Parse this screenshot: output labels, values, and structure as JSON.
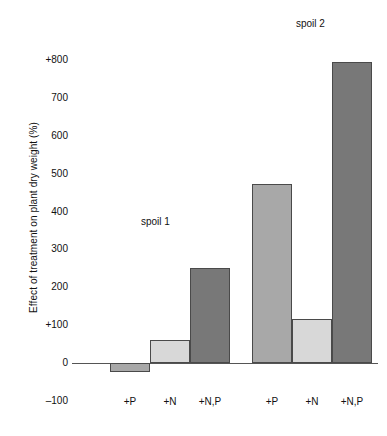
{
  "chart_data": {
    "type": "bar",
    "title": "",
    "xlabel": "",
    "ylabel": "Effect of treatment on plant dry weight (%)",
    "ylim": [
      -100,
      800
    ],
    "yticks": [
      {
        "label": "+800",
        "value": 800
      },
      {
        "label": "700",
        "value": 700
      },
      {
        "label": "600",
        "value": 600
      },
      {
        "label": "500",
        "value": 500
      },
      {
        "label": "400",
        "value": 400
      },
      {
        "label": "300",
        "value": 300
      },
      {
        "label": "200",
        "value": 200
      },
      {
        "label": "+100",
        "value": 100
      },
      {
        "label": "0",
        "value": 0
      },
      {
        "label": "–100",
        "value": -100
      }
    ],
    "grid": false,
    "legend": "none",
    "categories": [
      "+P",
      "+N",
      "+N,P",
      "+P",
      "+N",
      "+N,P"
    ],
    "values": [
      -25,
      60,
      250,
      472,
      115,
      795
    ],
    "groups": [
      {
        "name": "spoil 1",
        "annotation_label": "spoil 1",
        "bars": [
          {
            "category": "+P",
            "value": -25,
            "color": "#a8a8a8"
          },
          {
            "category": "+N",
            "value": 60,
            "color": "#d8d8d8"
          },
          {
            "category": "+N,P",
            "value": 250,
            "color": "#787878"
          }
        ]
      },
      {
        "name": "spoil 2",
        "annotation_label": "spoil 2",
        "bars": [
          {
            "category": "+P",
            "value": 472,
            "color": "#a8a8a8"
          },
          {
            "category": "+N",
            "value": 115,
            "color": "#d8d8d8"
          },
          {
            "category": "+N,P",
            "value": 795,
            "color": "#787878"
          }
        ]
      }
    ],
    "colors": {
      "light_gray": "#d8d8d8",
      "medium_gray": "#a8a8a8",
      "dark_gray": "#787878",
      "bar_outline": "#4a4a4a",
      "axis_line": "#555555",
      "background": "#ffffff",
      "text": "#111111"
    }
  }
}
